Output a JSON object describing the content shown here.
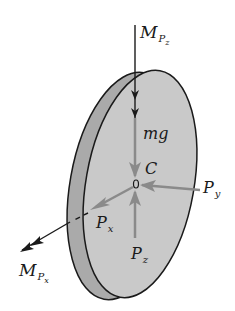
{
  "figure": {
    "colors": {
      "background": "#ffffff",
      "disk_face": "#c9c9c9",
      "disk_rim": "#aaaaaa",
      "outline": "#1a1a1a",
      "force_arrow_gray": "#8a8a8a",
      "moment_arrow": "#1a1a1a"
    },
    "labels": {
      "moment_z": {
        "main": "M",
        "sub": "P",
        "subsub": "z"
      },
      "weight": "mg",
      "center": "C",
      "center_mark": "0",
      "force_y": {
        "main": "P",
        "sub": "y"
      },
      "force_x": {
        "main": "P",
        "sub": "x"
      },
      "force_z": {
        "main": "P",
        "sub": "z"
      },
      "moment_x": {
        "main": "M",
        "sub": "P",
        "subsub": "x"
      }
    }
  }
}
